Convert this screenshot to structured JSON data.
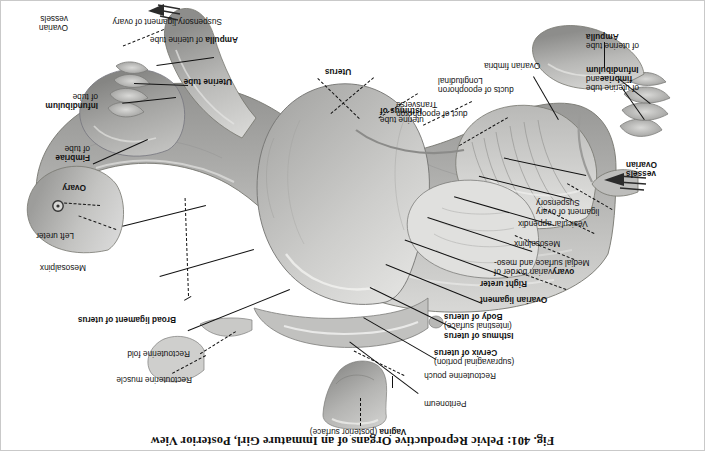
{
  "figure": {
    "title": "Fig. 401: Pelvic Reproductive Organs of an Immature Girl, Posterior View",
    "orientation": "rotated-180",
    "background_color": "#ffffff",
    "border_color": "#c9c9c9",
    "ink_color": "#111111",
    "art_style": "grayscale anatomical illustration"
  },
  "labels": {
    "vagina": {
      "line1": "Vagina",
      "line2": " (posterior surface)"
    },
    "peritoneum": "Peritoneum",
    "rectouterine_pouch": "Rectouterine pouch",
    "cervix_l1": "Cervix of uterus",
    "cervix_l2": "(supravaginal portion)",
    "isthmus_uterus_l1": "Isthmus of uterus",
    "body_uterus_l1": "Body of uterus",
    "body_uterus_l2": "(intestinal surface)",
    "ovarian_ligament": "Ovarian ligament",
    "right_ureter": "Right ureter",
    "medial_surface_l1": "Medial surface and meso-",
    "medial_surface_l2a": "varian border of ",
    "medial_surface_l2b": "ovary",
    "mesosalpinx_left": "Mesosalpinx",
    "vesicular_appendix": "Vesicular appendix",
    "suspensory_lig_l1": "Suspensory",
    "suspensory_lig_l2": "ligament of ovary",
    "ovarian_vessels_left_l1": "Ovarian",
    "ovarian_vessels_left_l2": "vessels",
    "infundibulum_left_l1": "Infundibulum",
    "infundibulum_left_l2a": "and ",
    "infundibulum_left_l2b": "fimbriae",
    "infundibulum_left_l3": "of uterine tube",
    "ampulla_left_l1": "Ampulla",
    "ampulla_left_l2": "of uterine tube",
    "ovarian_fimbria": "Ovarian fimbria",
    "longitudinal_l1": "Longitudinal",
    "longitudinal_l2": "ducts of epoophoron",
    "transverse_l1": "Transverse",
    "transverse_l2": "duct of epoophoron",
    "isthmus_tube_l1": "Isthmus of",
    "isthmus_tube_l2": "uterine tube",
    "uterus": "Uterus",
    "rectouterine_muscle": "Rectouterine muscle",
    "rectouterine_fold": "Rectouterine fold",
    "broad_ligament": "Broad ligament of uterus",
    "mesosalpinx_right": "Mesosalpinx",
    "left_ureter": "Left ureter",
    "ovary_right": "Ovary",
    "fimbriae_right_l1": "Fimbriae",
    "fimbriae_right_l2": "of tube",
    "infundibulum_right_l1": "Infundibulum",
    "infundibulum_right_l2": "of tube",
    "uterine_tube_right": "Uterine tube",
    "ampulla_right_l1": "Ampulla",
    "ampulla_right_l2": " of uterine tube",
    "suspensory_right": "Suspensory ligament of ovary",
    "ovarian_vessels_right_l1": "Ovarian",
    "ovarian_vessels_right_l2": "vessels"
  }
}
